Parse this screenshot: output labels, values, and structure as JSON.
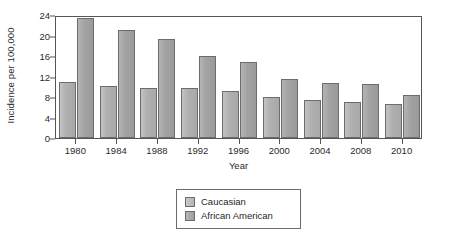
{
  "chart_data": {
    "type": "bar",
    "title": "",
    "xlabel": "Year",
    "ylabel": "Incidence per 100,000",
    "categories": [
      "1980",
      "1984",
      "1988",
      "1992",
      "1996",
      "2000",
      "2004",
      "2008",
      "2010"
    ],
    "series": [
      {
        "name": "Caucasian",
        "color": "#b4b4b4",
        "values": [
          11.0,
          10.1,
          9.8,
          9.7,
          9.2,
          8.0,
          7.4,
          7.1,
          6.6
        ]
      },
      {
        "name": "African American",
        "color": "#a0a0a0",
        "values": [
          23.5,
          21.0,
          19.4,
          16.1,
          14.8,
          11.6,
          10.8,
          10.5,
          8.4
        ]
      }
    ],
    "ylim": [
      0,
      24
    ],
    "yticks": [
      0,
      4,
      8,
      12,
      16,
      20,
      24
    ],
    "ytick_labels": [
      "0",
      "4",
      "8",
      "12",
      "16",
      "20",
      "24"
    ],
    "grid": false,
    "legend_position": "below-center",
    "frame": "box"
  }
}
